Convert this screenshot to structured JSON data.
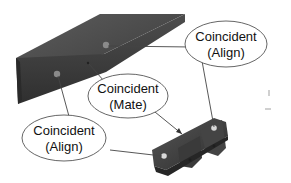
{
  "diagram": {
    "type": "cad-assembly-mates",
    "callouts": [
      {
        "id": "top-right",
        "line1": "Coincident",
        "line2": "(Align)"
      },
      {
        "id": "middle",
        "line1": "Coincident",
        "line2": "(Mate)"
      },
      {
        "id": "bottom-left",
        "line1": "Coincident",
        "line2": "(Align)"
      }
    ],
    "parts": [
      {
        "name": "beam",
        "color": "#4a4a4a"
      },
      {
        "name": "bracket",
        "color": "#3e3e3e"
      }
    ],
    "colors": {
      "background": "#ffffff",
      "ellipse_stroke": "#555555",
      "leader_line": "#444444",
      "text": "#111111"
    }
  }
}
